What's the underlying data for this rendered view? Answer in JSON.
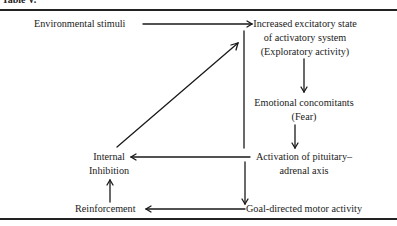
{
  "caption": "Table V.",
  "nodes": {
    "environmental_stimuli": "Environmental stimuli",
    "increased_excitatory": [
      "Increased excitatory state",
      "of activatory system",
      "(Exploratory activity)"
    ],
    "emotional_concomitants": [
      "Emotional concomitants",
      "(Fear)"
    ],
    "activation_pituitary": [
      "Activation of pituitary–",
      "adrenal axis"
    ],
    "internal_inhibition": [
      "Internal",
      "Inhibition"
    ],
    "reinforcement": "Reinforcement",
    "goal_directed": "Goal-directed motor activity"
  },
  "edges": [
    {
      "from": "Environmental stimuli",
      "to": "Increased excitatory state of activatory system"
    },
    {
      "from": "Increased excitatory state of activatory system",
      "to": "Emotional concomitants (Fear)"
    },
    {
      "from": "Emotional concomitants (Fear)",
      "to": "Activation of pituitary-adrenal axis"
    },
    {
      "from": "Activation of pituitary-adrenal axis",
      "to": "Internal Inhibition"
    },
    {
      "from": "Internal Inhibition",
      "to": "Increased excitatory state of activatory system"
    },
    {
      "from": "Increased excitatory state of activatory system",
      "to": "Goal-directed motor activity"
    },
    {
      "from": "Goal-directed motor activity",
      "to": "Reinforcement"
    },
    {
      "from": "Reinforcement",
      "to": "Internal Inhibition"
    }
  ]
}
